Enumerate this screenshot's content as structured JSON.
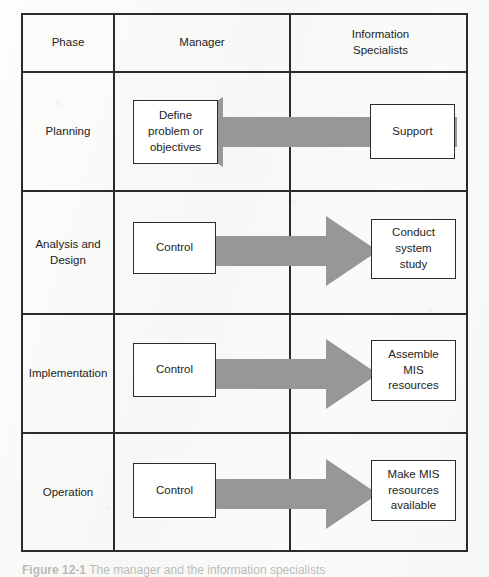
{
  "figure": {
    "caption_number": "Figure 12-1",
    "caption_text": "The manager and the information specialists"
  },
  "colors": {
    "arrow_gray": "#979797",
    "border": "#2b2b2b",
    "box_fill": "#ffffff",
    "page_background": "#fbfbfa"
  },
  "table": {
    "headers": [
      {
        "label": "Phase"
      },
      {
        "label": "Manager"
      },
      {
        "label": "Information\nSpecialists"
      }
    ],
    "header_information_specialists_line1": "Information",
    "header_information_specialists_line2": "Specialists",
    "rows": [
      {
        "phase": "Planning",
        "manager_box": "Define\nproblem  or\nobjectives",
        "manager_box_line1": "Define",
        "manager_box_line2": "problem  or",
        "manager_box_line3": "objectives",
        "specialist_box": "Support",
        "specialist_box_line1": "Support",
        "arrow_direction": "left"
      },
      {
        "phase": "Analysis and\nDesign",
        "phase_line1": "Analysis and",
        "phase_line2": "Design",
        "manager_box": "Control",
        "manager_box_line1": "Control",
        "specialist_box": "Conduct\nsystem\nstudy",
        "specialist_box_line1": "Conduct",
        "specialist_box_line2": "system",
        "specialist_box_line3": "study",
        "arrow_direction": "right"
      },
      {
        "phase": "Implementation",
        "manager_box": "Control",
        "manager_box_line1": "Control",
        "specialist_box": "Assemble\nMIS\nresources",
        "specialist_box_line1": "Assemble",
        "specialist_box_line2": "MIS",
        "specialist_box_line3": "resources",
        "arrow_direction": "right"
      },
      {
        "phase": "Operation",
        "manager_box": "Control",
        "manager_box_line1": "Control",
        "specialist_box": "Make MIS\nresources\navailable",
        "specialist_box_line1": "Make MIS",
        "specialist_box_line2": "resources",
        "specialist_box_line3": "available",
        "arrow_direction": "right"
      }
    ]
  }
}
